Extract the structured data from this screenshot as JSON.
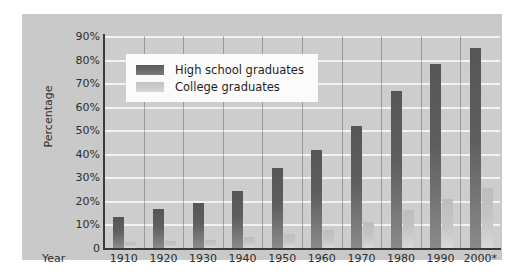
{
  "chart_data": {
    "type": "bar",
    "title": "",
    "xlabel": "Year",
    "ylabel": "Percentage",
    "ylim": [
      0,
      90
    ],
    "ytick_labels": [
      "90%",
      "80%",
      "70%",
      "60%",
      "50%",
      "40%",
      "30%",
      "20%",
      "10%",
      "0"
    ],
    "ytick_values": [
      90,
      80,
      70,
      60,
      50,
      40,
      30,
      20,
      10,
      0
    ],
    "grid": true,
    "legend_position": "upper-left-inside",
    "categories": [
      "1910",
      "1920",
      "1930",
      "1940",
      "1950",
      "1960",
      "1970",
      "1980",
      "1990",
      "2000*"
    ],
    "series": [
      {
        "name": "High school graduates",
        "color": "#5e5e5e",
        "values": [
          13,
          16.5,
          19,
          24,
          34,
          41.5,
          52,
          66.5,
          78,
          85
        ]
      },
      {
        "name": "College graduates",
        "color": "#c6c6c6",
        "values": [
          2.5,
          3,
          3.5,
          4.5,
          6,
          7.5,
          11,
          16,
          21,
          25.5
        ]
      }
    ],
    "annotations": [
      "2000*"
    ]
  },
  "legend": {
    "items": [
      {
        "label": "High school graduates"
      },
      {
        "label": "College graduates"
      }
    ]
  },
  "axis": {
    "y_title": "Percentage",
    "x_title": "Year"
  }
}
